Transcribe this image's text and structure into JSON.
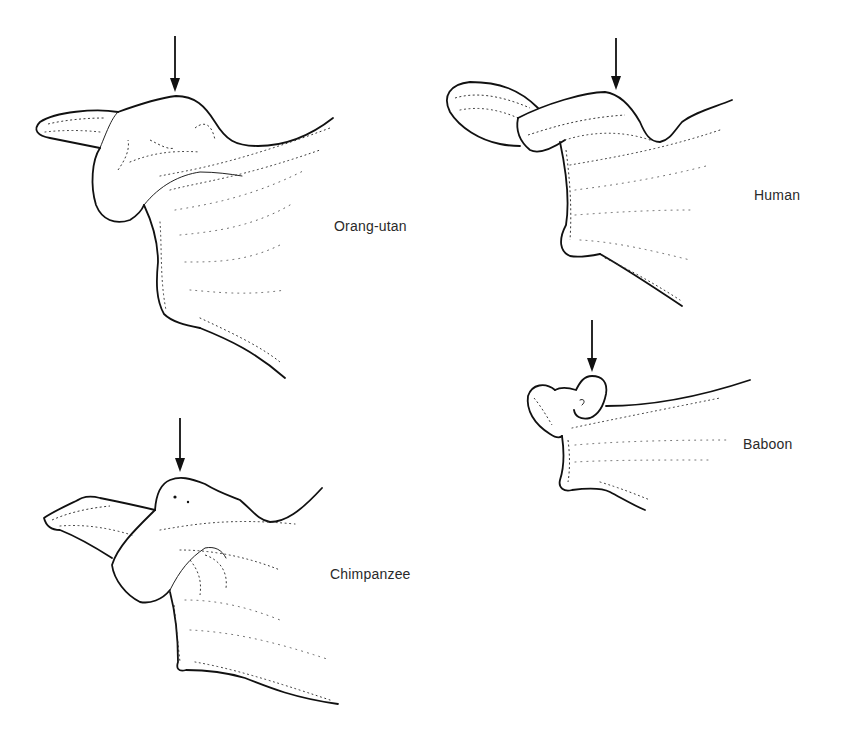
{
  "figure": {
    "panels": [
      {
        "id": "orang-utan",
        "label": "Orang-utan",
        "arrow": "arrow-pointing-down"
      },
      {
        "id": "human",
        "label": "Human",
        "arrow": "arrow-pointing-down"
      },
      {
        "id": "baboon",
        "label": "Baboon",
        "arrow": "arrow-pointing-down"
      },
      {
        "id": "chimpanzee",
        "label": "Chimpanzee",
        "arrow": "arrow-pointing-down"
      }
    ],
    "colors": {
      "line": "#111111",
      "label": "#2a2a2a",
      "background": "#ffffff"
    }
  }
}
